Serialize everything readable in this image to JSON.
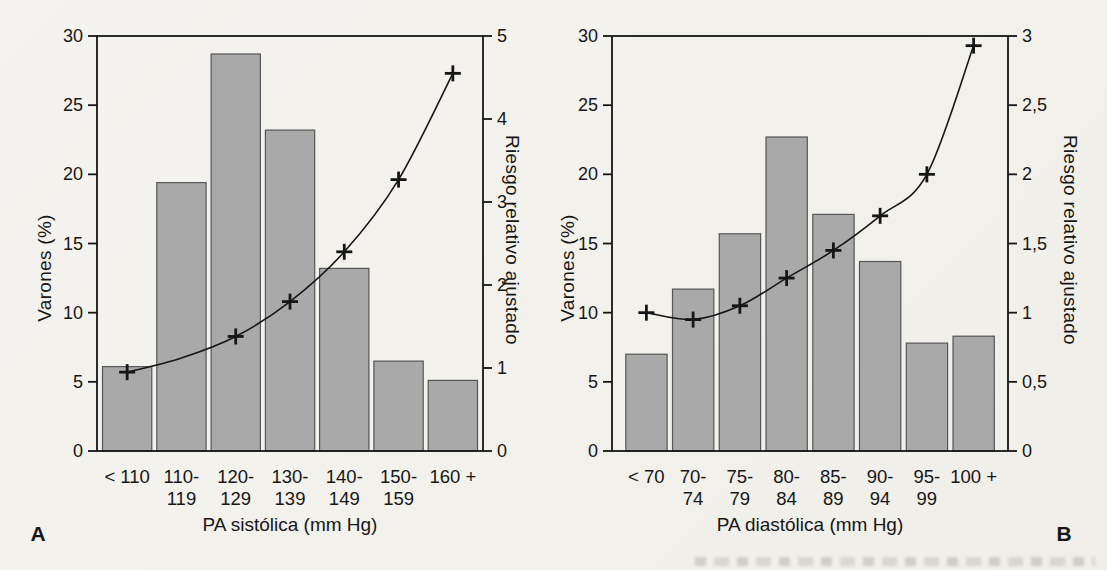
{
  "figure": {
    "description_labels": {
      "panel_a_letter": "A",
      "panel_b_letter": "B"
    }
  },
  "colors": {
    "paper": "#f3f1ec",
    "bar_fill": "#a9a9a9",
    "bar_stroke": "#565656",
    "axis_and_line": "#161616",
    "text": "#161616"
  },
  "chart_data": [
    {
      "type": "bar+line",
      "panel_label": "A",
      "ylabel_left": "Varones (%)",
      "ylabel_right": "Riesgo relativo ajustado",
      "xlabel": "PA sistólica (mm Hg)",
      "categories_line1": [
        "< 110",
        "110-",
        "120-",
        "130-",
        "140-",
        "150-",
        "160 +"
      ],
      "categories_line2": [
        "",
        "119",
        "129",
        "139",
        "149",
        "159",
        ""
      ],
      "bar_values_pct": [
        6.1,
        19.4,
        28.7,
        23.2,
        13.2,
        6.5,
        5.1
      ],
      "line_values_rr": [
        0.95,
        1.12,
        1.38,
        1.8,
        2.4,
        3.27,
        4.55
      ],
      "line_marker_shown": [
        true,
        false,
        true,
        true,
        true,
        true,
        true
      ],
      "y_left": {
        "min": 0,
        "max": 30,
        "ticks": [
          0,
          5,
          10,
          15,
          20,
          25,
          30
        ],
        "tick_labels": [
          "0",
          "5",
          "10",
          "15",
          "20",
          "25",
          "30"
        ]
      },
      "y_right": {
        "min": 0,
        "max": 5,
        "ticks": [
          0,
          1,
          2,
          3,
          4,
          5
        ],
        "tick_labels": [
          "0",
          "1",
          "2",
          "3",
          "4",
          "5"
        ]
      },
      "grid": false,
      "legend": "none"
    },
    {
      "type": "bar+line",
      "panel_label": "B",
      "ylabel_left": "Varones (%)",
      "ylabel_right": "Riesgo relativo ajustado",
      "xlabel": "PA diastólica (mm Hg)",
      "categories_line1": [
        "< 70",
        "70-",
        "75-",
        "80-",
        "85-",
        "90-",
        "95-",
        "100 +"
      ],
      "categories_line2": [
        "",
        "74",
        "79",
        "84",
        "89",
        "94",
        "99",
        ""
      ],
      "bar_values_pct": [
        7.0,
        11.7,
        15.7,
        22.7,
        17.1,
        13.7,
        7.8,
        8.3
      ],
      "line_values_rr": [
        1.0,
        0.95,
        1.05,
        1.25,
        1.45,
        1.7,
        2.0,
        2.93
      ],
      "line_marker_shown": [
        true,
        true,
        true,
        true,
        true,
        true,
        true,
        true
      ],
      "y_left": {
        "min": 0,
        "max": 30,
        "ticks": [
          0,
          5,
          10,
          15,
          20,
          25,
          30
        ],
        "tick_labels": [
          "0",
          "5",
          "10",
          "15",
          "20",
          "25",
          "30"
        ]
      },
      "y_right": {
        "min": 0,
        "max": 3,
        "ticks": [
          0,
          0.5,
          1,
          1.5,
          2,
          2.5,
          3
        ],
        "tick_labels": [
          "0",
          "0,5",
          "1",
          "1,5",
          "2",
          "2,5",
          "3"
        ]
      },
      "grid": false,
      "legend": "none"
    }
  ]
}
